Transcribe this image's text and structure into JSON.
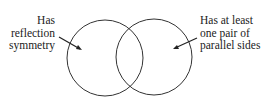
{
  "diagram": {
    "type": "venn",
    "sets": [
      {
        "id": "left",
        "label_lines": [
          "Has",
          "reflection",
          "symmetry"
        ],
        "cx": 105,
        "cy": 58,
        "r": 38
      },
      {
        "id": "right",
        "label_lines": [
          "Has at least",
          "one pair of",
          "parallel sides"
        ],
        "cx": 154,
        "cy": 57,
        "r": 38
      }
    ],
    "stroke_color": "#333333"
  }
}
